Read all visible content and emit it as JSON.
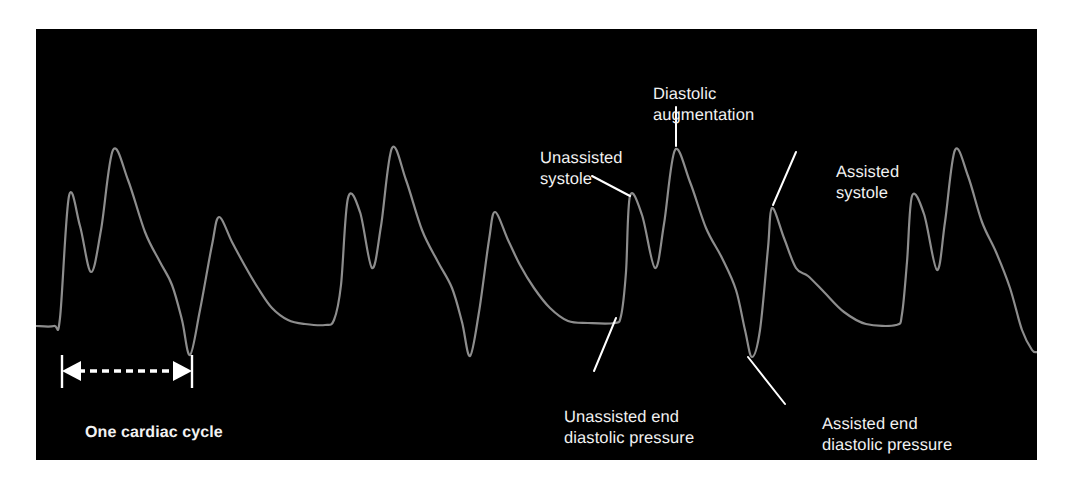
{
  "figure": {
    "kind": "iabp-arterial-pressure-waveform",
    "panel_background": "#000000",
    "page_background": "#ffffff",
    "trace_color": "#8d8d8d",
    "label_color": "#f2f2f2",
    "leader_color": "#ffffff"
  },
  "annotations": {
    "unassisted_systole": "Unassisted\nsystole",
    "diastolic_augmentation": "Diastolic\naugmentation",
    "assisted_systole": "Assisted\nsystole",
    "unassisted_end_diastolic_pressure": "Unassisted end\ndiastolic pressure",
    "assisted_end_diastolic_pressure": "Assisted end\ndiastolic pressure",
    "one_cardiac_cycle": "One cardiac cycle"
  },
  "chart_data": {
    "type": "line",
    "title": "",
    "xlabel": "",
    "ylabel": "",
    "grid": false,
    "legend": "none",
    "axis_note": "Pressure (vertical, higher = upward) vs time (horizontal). No numeric axes are drawn.",
    "panel_px": {
      "x": 36,
      "y": 29,
      "width": 1001,
      "height": 431
    },
    "reference_levels_px": {
      "unassisted_end_diastolic_baseline_y": 324,
      "assisted_end_diastolic_trough_y": 355,
      "systolic_peak_y": 196,
      "diastolic_augmentation_peak_y": 150,
      "assisted_systolic_peak_y": 208
    },
    "beats": [
      {
        "index": 1,
        "type": "assisted",
        "systolic_peak": {
          "x": 69,
          "y": 197
        },
        "dicrotic_notch": {
          "x": 91,
          "y": 272
        },
        "diastolic_augmentation_peak": {
          "x": 113,
          "y": 150
        },
        "end_diastolic_trough": {
          "x": 190,
          "y": 355
        }
      },
      {
        "index": 2,
        "type": "unassisted-then-baseline",
        "systolic_peak": {
          "x": 219,
          "y": 217
        },
        "shoulder": {
          "x": 245,
          "y": 265
        },
        "baseline_plateau": {
          "x_start": 290,
          "x_end": 330,
          "y": 324
        }
      },
      {
        "index": 3,
        "type": "assisted",
        "systolic_peak": {
          "x": 348,
          "y": 198
        },
        "dicrotic_notch": {
          "x": 372,
          "y": 268
        },
        "diastolic_augmentation_peak": {
          "x": 392,
          "y": 148
        },
        "end_diastolic_trough": {
          "x": 470,
          "y": 356
        }
      },
      {
        "index": 4,
        "type": "unassisted-then-baseline",
        "systolic_peak": {
          "x": 495,
          "y": 212
        },
        "shoulder": {
          "x": 520,
          "y": 265
        },
        "baseline_plateau": {
          "x_start": 565,
          "x_end": 615,
          "y": 323
        }
      },
      {
        "index": 5,
        "type": "assisted",
        "systolic_peak": {
          "x": 630,
          "y": 195
        },
        "dicrotic_notch": {
          "x": 655,
          "y": 268
        },
        "diastolic_augmentation_peak": {
          "x": 675,
          "y": 150
        },
        "end_diastolic_trough": {
          "x": 752,
          "y": 357
        }
      },
      {
        "index": 6,
        "type": "assisted-systole",
        "systolic_peak": {
          "x": 772,
          "y": 208
        },
        "shoulder": {
          "x": 800,
          "y": 270
        },
        "baseline_plateau": {
          "x_start": 845,
          "x_end": 890,
          "y": 324
        }
      },
      {
        "index": 7,
        "type": "assisted",
        "systolic_peak": {
          "x": 912,
          "y": 195
        },
        "dicrotic_notch": {
          "x": 937,
          "y": 270
        },
        "diastolic_augmentation_peak": {
          "x": 955,
          "y": 150
        },
        "trailing_edge": {
          "x": 1030,
          "y": 350
        }
      }
    ],
    "cycle_marker": {
      "label": "One cardiac cycle",
      "left_tick_x": 62,
      "right_tick_x": 192,
      "tick_top_y": 355,
      "tick_bottom_y": 388,
      "arrow_y": 371,
      "style": "dashed double-headed arrow between two solid vertical end bars"
    },
    "leader_lines": [
      {
        "label": "unassisted_systole",
        "from_px": [
          592,
          176
        ],
        "to_px": [
          630,
          196
        ],
        "style": "solid"
      },
      {
        "label": "diastolic_augmentation",
        "from_px": [
          676,
          107
        ],
        "to_px": [
          676,
          146
        ],
        "style": "solid vertical"
      },
      {
        "label": "assisted_systole",
        "from_px": [
          796,
          152
        ],
        "to_px": [
          773,
          205
        ],
        "style": "solid"
      },
      {
        "label": "unassisted_end_diastolic_pressure",
        "from_px": [
          594,
          371
        ],
        "to_px": [
          616,
          318
        ],
        "style": "solid"
      },
      {
        "label": "assisted_end_diastolic_pressure",
        "from_px": [
          785,
          404
        ],
        "to_px": [
          748,
          357
        ],
        "style": "solid"
      }
    ]
  }
}
